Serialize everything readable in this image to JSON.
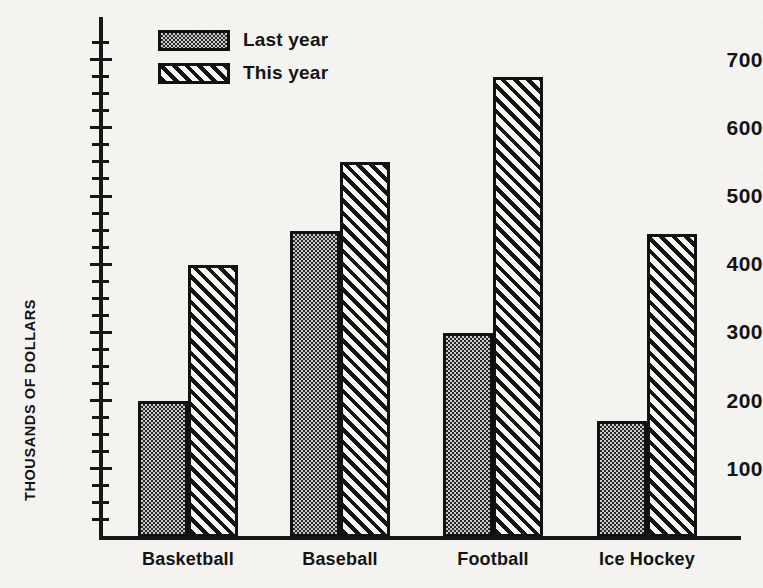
{
  "chart_data": {
    "type": "bar",
    "title": "",
    "subtitle": "",
    "xlabel": "",
    "ylabel": "THOUSANDS OF DOLLARS",
    "categories": [
      "Basketball",
      "Baseball",
      "Football",
      "Ice Hockey"
    ],
    "series": [
      {
        "name": "Last year",
        "values": [
          195,
          445,
          295,
          165
        ],
        "fill": "stipple"
      },
      {
        "name": "This year",
        "values": [
          395,
          545,
          670,
          440
        ],
        "fill": "diagonal-hatch"
      }
    ],
    "ylim": [
      0,
      740
    ],
    "y_major_ticks": [
      100,
      200,
      300,
      400,
      500,
      600,
      700
    ],
    "y_tick_labels": [
      "100",
      "200",
      "300",
      "400",
      "500",
      "600",
      "700"
    ],
    "y_minor_tick_interval": 25,
    "x_axis_ticks": false,
    "grid": false,
    "legend_position": "top-left-inside",
    "orientation": "vertical",
    "grouping": "clustered",
    "bar_outline_color": "#111111",
    "background_color": "#f4f3f0",
    "text_color": "#141414"
  },
  "legend": {
    "entries": [
      {
        "label": "Last year",
        "swatch": "stipple-swatch"
      },
      {
        "label": "This year",
        "swatch": "hatch-swatch"
      }
    ]
  }
}
